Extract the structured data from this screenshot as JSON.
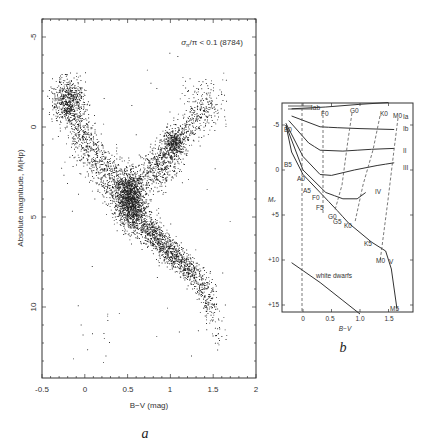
{
  "figure": {
    "panel_a": {
      "caption": "a",
      "annotation": "σπ/π < 0.1 (8784)",
      "annotation_main": "/π < 0.1 (8784)",
      "annotation_sigma": "σ",
      "annotation_sub": "π",
      "xlabel": "B−V (mag)",
      "ylabel": "Absolute magnitude, M(Hp)",
      "x_ticks": [
        "-0.5",
        "0",
        "0.5",
        "1",
        "1.5",
        "2"
      ],
      "y_ticks": [
        "-5",
        "0",
        "5",
        "10"
      ]
    },
    "panel_b": {
      "caption": "b",
      "xlabel": "B−V",
      "ylabel": "Mᵥ",
      "x_ticks": [
        "0",
        "0.5",
        "1.0",
        "1.5"
      ],
      "y_ticks": [
        "-5",
        "0",
        "+5",
        "+10",
        "+15"
      ],
      "luminosity_classes": [
        "Iab",
        "Ia",
        "Ib",
        "II",
        "III",
        "IV",
        "V"
      ],
      "spectral_labels_top": [
        "F0",
        "G0",
        "K0",
        "M0"
      ],
      "spectral_labels_ms": [
        "B0",
        "B5",
        "A0",
        "A5",
        "F0",
        "F5",
        "G0",
        "G5",
        "K0",
        "K5",
        "M0",
        "M5"
      ],
      "white_dwarfs_label": "white dwarfs"
    }
  },
  "chart_data": [
    {
      "type": "scatter",
      "title": "σπ/π < 0.1 (8784)",
      "xlabel": "B−V (mag)",
      "ylabel": "Absolute magnitude, M(Hp)",
      "xlim": [
        -0.5,
        2.0
      ],
      "ylim": [
        14,
        -6
      ],
      "y_inverted": true,
      "n_points": 8784,
      "x_ticks": [
        -0.5,
        0,
        0.5,
        1,
        1.5,
        2
      ],
      "y_ticks": [
        -5,
        0,
        5,
        10
      ],
      "features": [
        {
          "name": "main sequence",
          "path_bv_mag": [
            [
              -0.2,
              -1.5
            ],
            [
              0.0,
              1.0
            ],
            [
              0.3,
              2.8
            ],
            [
              0.5,
              4.0
            ],
            [
              0.6,
              4.8
            ],
            [
              0.8,
              6.0
            ],
            [
              1.0,
              7.0
            ],
            [
              1.2,
              7.8
            ],
            [
              1.4,
              9.0
            ],
            [
              1.5,
              10.5
            ],
            [
              1.6,
              12.0
            ]
          ]
        },
        {
          "name": "red giant clump",
          "center_bv_mag": [
            1.05,
            0.8
          ]
        },
        {
          "name": "red giant branch",
          "path_bv_mag": [
            [
              0.85,
              3.0
            ],
            [
              1.0,
              1.5
            ],
            [
              1.2,
              0.0
            ],
            [
              1.5,
              -1.5
            ]
          ]
        },
        {
          "name": "white dwarfs (sparse)",
          "region_bv": [
            -0.2,
            0.5
          ],
          "region_mag": [
            10,
            13
          ]
        }
      ]
    },
    {
      "type": "line",
      "title": "Hertzsprung-Russell diagram with luminosity classes",
      "xlabel": "B−V",
      "ylabel": "Mv",
      "xlim": [
        -0.45,
        1.95
      ],
      "ylim": [
        16,
        -7
      ],
      "y_inverted": true,
      "x_ticks": [
        0,
        0.5,
        1.0,
        1.5
      ],
      "y_ticks": [
        -5,
        0,
        5,
        10,
        15
      ],
      "series": [
        {
          "name": "Ia",
          "points": [
            [
              -0.2,
              -6.8
            ],
            [
              0.4,
              -7.0
            ],
            [
              1.0,
              -7.3
            ],
            [
              1.5,
              -7.5
            ]
          ]
        },
        {
          "name": "Ib",
          "points": [
            [
              -0.2,
              -6.0
            ],
            [
              0.3,
              -4.8
            ],
            [
              0.6,
              -4.7
            ],
            [
              1.0,
              -4.6
            ],
            [
              1.6,
              -4.5
            ]
          ]
        },
        {
          "name": "II",
          "points": [
            [
              -0.25,
              -5.5
            ],
            [
              0.1,
              -3.0
            ],
            [
              0.3,
              -2.2
            ],
            [
              0.7,
              -2.1
            ],
            [
              1.2,
              -2.3
            ],
            [
              1.6,
              -2.4
            ]
          ]
        },
        {
          "name": "III",
          "points": [
            [
              -0.3,
              -5.2
            ],
            [
              0.0,
              -1.5
            ],
            [
              0.3,
              0.5
            ],
            [
              0.5,
              0.6
            ],
            [
              0.9,
              0.0
            ],
            [
              1.3,
              -0.5
            ],
            [
              1.6,
              -0.8
            ]
          ]
        },
        {
          "name": "IV",
          "points": [
            [
              -0.3,
              -5.0
            ],
            [
              0.0,
              0.0
            ],
            [
              0.4,
              2.5
            ],
            [
              0.7,
              3.2
            ],
            [
              0.95,
              3.2
            ],
            [
              1.1,
              2.5
            ]
          ]
        },
        {
          "name": "V",
          "points": [
            [
              -0.3,
              -5.0
            ],
            [
              -0.2,
              -2.0
            ],
            [
              0.0,
              0.5
            ],
            [
              0.3,
              2.5
            ],
            [
              0.6,
              4.5
            ],
            [
              0.8,
              5.9
            ],
            [
              1.2,
              8.0
            ],
            [
              1.45,
              9.0
            ],
            [
              1.55,
              11.0
            ],
            [
              1.65,
              15.5
            ]
          ]
        },
        {
          "name": "white dwarfs",
          "points": [
            [
              -0.2,
              10.3
            ],
            [
              0.3,
              12.5
            ],
            [
              0.7,
              14.5
            ],
            [
              1.0,
              16.0
            ]
          ]
        }
      ],
      "spectral_type_lines": [
        "B0",
        "F0",
        "G0",
        "K0",
        "M0"
      ]
    }
  ]
}
